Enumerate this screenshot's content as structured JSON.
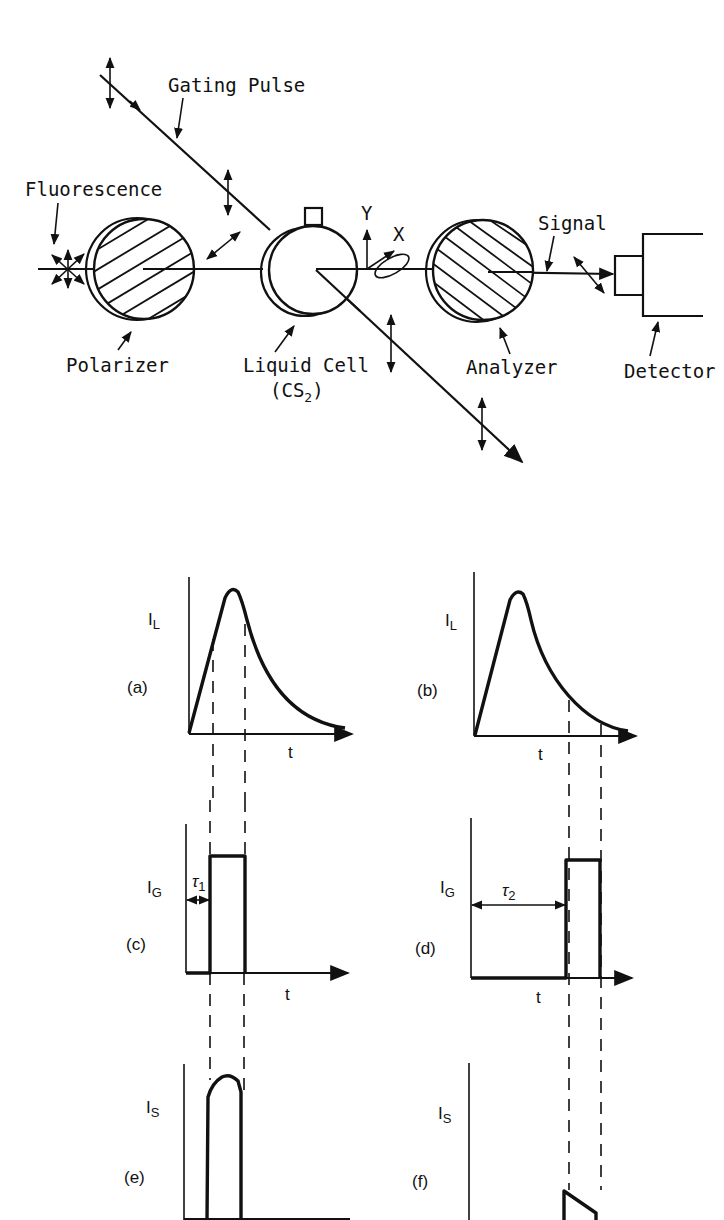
{
  "setup": {
    "labels": {
      "gating_pulse": "Gating Pulse",
      "fluorescence": "Fluorescence",
      "polarizer": "Polarizer",
      "liquid_cell": "Liquid Cell",
      "liquid_cell_substance": "CS",
      "liquid_cell_subscript": "2",
      "axis_y": "Y",
      "axis_x": "X",
      "signal": "Signal",
      "analyzer": "Analyzer",
      "detector": "Detector"
    },
    "components": [
      "Fluorescence source",
      "Polarizer",
      "Liquid Cell (CS2)",
      "Analyzer",
      "Detector"
    ]
  },
  "graphs": [
    {
      "id": "a",
      "panel": "(a)",
      "ylabel": "I",
      "ysub": "L",
      "xlabel": "t",
      "shape": "pulse rise and exponential decay; gate window early near peak"
    },
    {
      "id": "b",
      "panel": "(b)",
      "ylabel": "I",
      "ysub": "L",
      "xlabel": "t",
      "shape": "pulse rise and exponential decay; gate window late in tail"
    },
    {
      "id": "c",
      "panel": "(c)",
      "ylabel": "I",
      "ysub": "G",
      "xlabel": "t",
      "delay": "τ",
      "delay_sub": "1",
      "shape": "rectangular gate pulse with short delay"
    },
    {
      "id": "d",
      "panel": "(d)",
      "ylabel": "I",
      "ysub": "G",
      "xlabel": "t",
      "delay": "τ",
      "delay_sub": "2",
      "shape": "rectangular gate pulse with long delay"
    },
    {
      "id": "e",
      "panel": "(e)",
      "ylabel": "I",
      "ysub": "S",
      "shape": "gated signal, high peak portion"
    },
    {
      "id": "f",
      "panel": "(f)",
      "ylabel": "I",
      "ysub": "S",
      "shape": "gated signal, small tail portion"
    }
  ]
}
